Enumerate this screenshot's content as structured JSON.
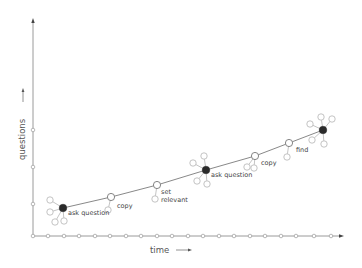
{
  "diagram": {
    "axes": {
      "x_label": "time",
      "y_label": "questions",
      "x_ticks": [
        33,
        48,
        64,
        79,
        95,
        110,
        126,
        141,
        157,
        172,
        188,
        203,
        219,
        234,
        250,
        265,
        281,
        296,
        314,
        331
      ],
      "y_ticks": [
        130,
        167,
        204
      ]
    },
    "colors": {
      "axis": "#9a9a9a",
      "line": "#555555",
      "dark_node": "#2b2b2b",
      "open_node": "#777777",
      "satellite": "#aaaaaa"
    },
    "nodes": [
      {
        "id": 1,
        "type": "dark",
        "x": 63,
        "y": 208,
        "label": "ask question",
        "label_x": 68,
        "label_y": 215,
        "satellites": [
          [
            50,
            200
          ],
          [
            50,
            212
          ],
          [
            55,
            222
          ],
          [
            64,
            221
          ]
        ]
      },
      {
        "id": 2,
        "type": "open",
        "x": 111,
        "y": 197,
        "label": "copy",
        "label_x": 117,
        "label_y": 208,
        "satellites": [
          [
            108,
            210
          ]
        ]
      },
      {
        "id": 3,
        "type": "open",
        "x": 157,
        "y": 185,
        "label": "set",
        "label2": "relevant",
        "label_x": 161,
        "label_y": 194,
        "satellites": [
          [
            155,
            199
          ]
        ]
      },
      {
        "id": 4,
        "type": "dark",
        "x": 206,
        "y": 170,
        "label": "ask question",
        "label_x": 211,
        "label_y": 177,
        "satellites": [
          [
            193,
            163
          ],
          [
            204,
            156
          ],
          [
            197,
            181
          ],
          [
            207,
            184
          ]
        ]
      },
      {
        "id": 5,
        "type": "open",
        "x": 255,
        "y": 156,
        "label": "copy",
        "label_x": 261,
        "label_y": 165,
        "satellites": [
          [
            247,
            167
          ],
          [
            254,
            168
          ]
        ]
      },
      {
        "id": 6,
        "type": "open",
        "x": 289,
        "y": 143,
        "label": "find",
        "label_x": 296,
        "label_y": 152,
        "satellites": [
          [
            287,
            157
          ]
        ]
      },
      {
        "id": 7,
        "type": "dark",
        "x": 323,
        "y": 130,
        "label": "",
        "label_x": 0,
        "label_y": 0,
        "satellites": [
          [
            310,
            124
          ],
          [
            321,
            117
          ],
          [
            332,
            119
          ],
          [
            312,
            140
          ],
          [
            324,
            144
          ]
        ]
      }
    ]
  }
}
